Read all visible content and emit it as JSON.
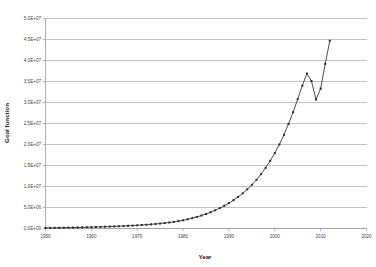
{
  "chart_data": {
    "type": "line",
    "title": "",
    "subtitle": "",
    "xlabel": "Year",
    "ylabel": "Goal function",
    "xlim": [
      1950,
      2020
    ],
    "ylim": [
      0,
      50000000
    ],
    "grid": "horizontal",
    "legend": "none",
    "marker": "square",
    "marker_color": "#2b2b2b",
    "line_color": "#3a3a3a",
    "grid_color": "#a8a8a8",
    "axis_color": "#9a9a9a",
    "xticks": [
      1950,
      1960,
      1970,
      1980,
      1990,
      2000,
      2010,
      2020
    ],
    "xtick_labels": [
      "1950",
      "1960",
      "1970",
      "1980",
      "1990",
      "2000",
      "2010",
      "2020"
    ],
    "yticks": [
      0,
      5000000,
      10000000,
      15000000,
      20000000,
      25000000,
      30000000,
      35000000,
      40000000,
      45000000,
      50000000
    ],
    "ytick_labels": [
      "0.0E+00",
      "5.0E+06",
      "1.0E+07",
      "1.5E+07",
      "2.0E+07",
      "2.5E+07",
      "3.0E+07",
      "3.5E+07",
      "4.0E+07",
      "4.5E+07",
      "5.0E+07"
    ],
    "series": [
      {
        "name": "Goal function",
        "x": [
          1950,
          1951,
          1952,
          1953,
          1954,
          1955,
          1956,
          1957,
          1958,
          1959,
          1960,
          1961,
          1962,
          1963,
          1964,
          1965,
          1966,
          1967,
          1968,
          1969,
          1970,
          1971,
          1972,
          1973,
          1974,
          1975,
          1976,
          1977,
          1978,
          1979,
          1980,
          1981,
          1982,
          1983,
          1984,
          1985,
          1986,
          1987,
          1988,
          1989,
          1990,
          1991,
          1992,
          1993,
          1994,
          1995,
          1996,
          1997,
          1998,
          1999,
          2000,
          2001,
          2002,
          2003,
          2004,
          2005,
          2006,
          2007,
          2008,
          2009,
          2010,
          2011,
          2012
        ],
        "values": [
          120000,
          135000,
          150000,
          168000,
          185000,
          205000,
          225000,
          248000,
          272000,
          298000,
          325000,
          355000,
          388000,
          422000,
          460000,
          500000,
          545000,
          592000,
          645000,
          700000,
          760000,
          830000,
          905000,
          990000,
          1080000,
          1185000,
          1300000,
          1430000,
          1580000,
          1760000,
          1960000,
          2190000,
          2450000,
          2750000,
          3080000,
          3450000,
          3870000,
          4330000,
          4850000,
          5420000,
          6050000,
          6750000,
          7520000,
          8380000,
          9330000,
          10400000,
          11600000,
          12950000,
          14450000,
          16100000,
          17950000,
          20000000,
          22300000,
          24900000,
          27700000,
          30800000,
          34000000,
          36900000,
          35100000,
          30700000,
          33300000,
          39200000,
          44700000
        ]
      }
    ],
    "annotations": [
      {
        "label": "local peak",
        "x": 2007,
        "y": 36900000
      },
      {
        "label": "local trough",
        "x": 2009,
        "y": 30700000
      },
      {
        "label": "final point",
        "x": 2012,
        "y": 44700000
      }
    ]
  }
}
